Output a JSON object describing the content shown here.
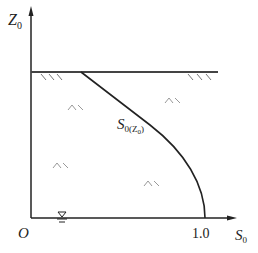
{
  "axes": {
    "y_label": "Z",
    "y_label_sub": "0",
    "x_label": "S",
    "x_label_sub": "0",
    "origin_label": "O",
    "x_tick_label": "1.0"
  },
  "curve": {
    "label_main": "S",
    "label_sub": "0(Z",
    "label_sub2": "0",
    "label_close": ")"
  },
  "colors": {
    "line": "#222222",
    "hatch": "#888888"
  }
}
